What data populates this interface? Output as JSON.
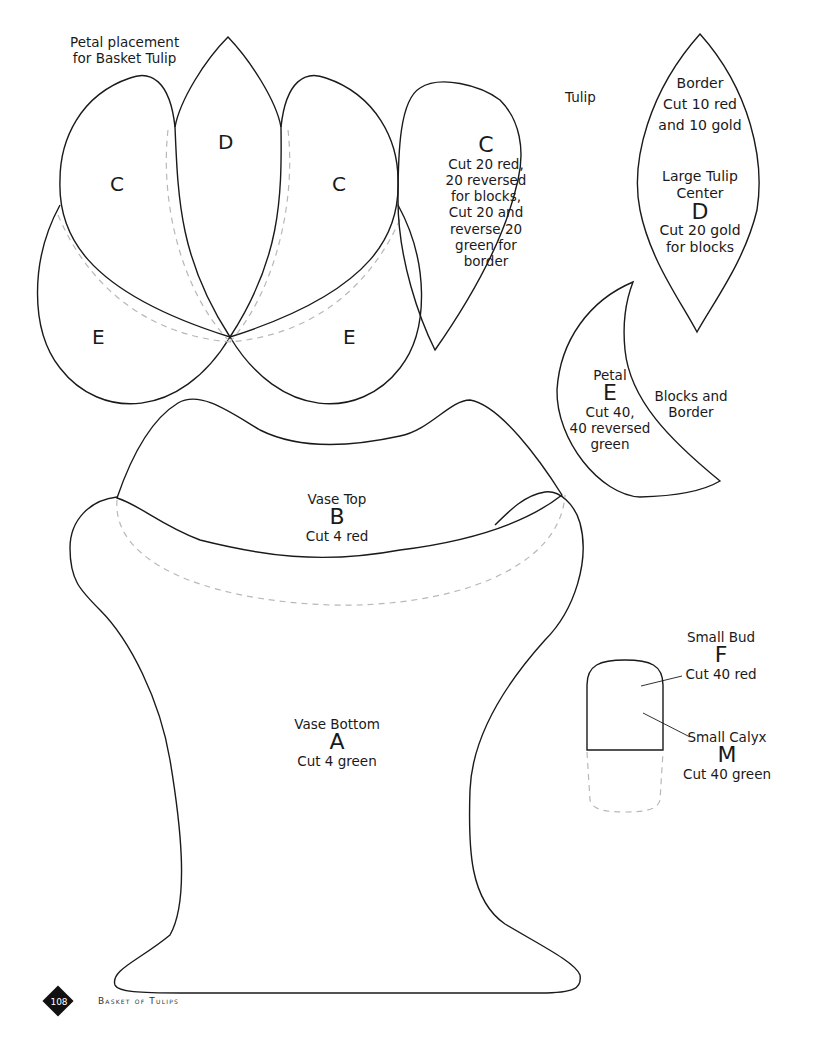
{
  "placement": {
    "caption": [
      "Petal placement",
      "for Basket Tulip"
    ],
    "letters": {
      "c_left": "C",
      "d_center": "D",
      "c_right": "C",
      "e_left": "E",
      "e_right": "E"
    }
  },
  "tulip_c": {
    "tag": "Tulip",
    "letter": "C",
    "lines": [
      "Cut 20 red,",
      "20 reversed",
      "for blocks,",
      "Cut 20 and",
      "reverse 20",
      "green for",
      "border"
    ]
  },
  "border_d": {
    "border_lines": [
      "Border",
      "Cut 10 red",
      "and 10 gold"
    ],
    "center_lines": [
      "Large Tulip",
      "Center"
    ],
    "letter": "D",
    "cut_lines": [
      "Cut 20 gold",
      "for blocks"
    ]
  },
  "petal_e": {
    "title": "Petal",
    "letter": "E",
    "lines": [
      "Cut 40,",
      "40 reversed",
      "green"
    ],
    "side_lines": [
      "Blocks and",
      "Border"
    ]
  },
  "vase_top": {
    "title": "Vase Top",
    "letter": "B",
    "cut": "Cut 4 red"
  },
  "vase_bottom": {
    "title": "Vase Bottom",
    "letter": "A",
    "cut": "Cut 4 green"
  },
  "small_bud": {
    "title": "Small Bud",
    "letter": "F",
    "cut": "Cut 40 red"
  },
  "small_calyx": {
    "title": "Small Calyx",
    "letter": "M",
    "cut": "Cut 40 green"
  },
  "footer": {
    "page_number": "108",
    "title": "Basket of Tulips"
  },
  "colors": {
    "stroke": "#1a1a1a",
    "dashed_guide": "#b8b8b8",
    "badge": "#111111"
  }
}
